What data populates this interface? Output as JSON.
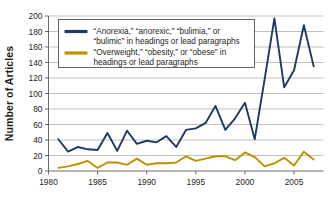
{
  "chart_data": {
    "type": "line",
    "title": "",
    "subtitle": "",
    "xlabel": "",
    "ylabel": "Number of Articles",
    "xlim": [
      1980,
      2008
    ],
    "ylim": [
      0,
      200
    ],
    "ytick_step": 20,
    "xtick_step": 5,
    "grid": true,
    "grid_axis": "y",
    "legend_position": "top-left-inside",
    "xticks": [
      "1980",
      "1985",
      "1990",
      "1995",
      "2000",
      "2005"
    ],
    "xtick_values": [
      1980,
      1985,
      1990,
      1995,
      2000,
      2005
    ],
    "yticks": [
      "0",
      "20",
      "40",
      "60",
      "80",
      "100",
      "120",
      "140",
      "160",
      "180",
      "200"
    ],
    "ytick_values": [
      0,
      20,
      40,
      60,
      80,
      100,
      120,
      140,
      160,
      180,
      200
    ],
    "x": [
      1981,
      1982,
      1983,
      1984,
      1985,
      1986,
      1987,
      1988,
      1989,
      1990,
      1991,
      1992,
      1993,
      1994,
      1995,
      1996,
      1997,
      1998,
      1999,
      2000,
      2001,
      2002,
      2003,
      2004,
      2005,
      2006,
      2007
    ],
    "series": [
      {
        "name": "anorexia-bulimia",
        "label_line1": "“Anorexia,” “anorexic,” “bulimia,” or",
        "label_line2": "“bulimic” in headings or lead paragraphs",
        "color": "#1F3864",
        "values": [
          41,
          25,
          31,
          28,
          27,
          49,
          26,
          52,
          35,
          39,
          37,
          45,
          31,
          53,
          55,
          62,
          84,
          53,
          68,
          88,
          41,
          118,
          197,
          108,
          130,
          188,
          135
        ]
      },
      {
        "name": "overweight-obesity",
        "label_line1": "“Overweight,” “obesity,” or “obese” in",
        "label_line2": "headings or lead paragraphs",
        "color": "#BF9000",
        "values": [
          4,
          6,
          9,
          13,
          4,
          11,
          11,
          8,
          16,
          8,
          10,
          10,
          11,
          19,
          13,
          16,
          19,
          19,
          14,
          24,
          18,
          6,
          10,
          17,
          7,
          25,
          15
        ]
      }
    ]
  },
  "axis": {
    "ylabel": "Number of Articles"
  }
}
